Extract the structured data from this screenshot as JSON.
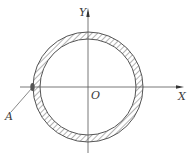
{
  "diagram": {
    "type": "annular cross-section (hollow circular tube) with coordinate axes",
    "labels": {
      "y_axis": "Y",
      "x_axis": "X",
      "origin": "O",
      "point": "A"
    },
    "colors": {
      "line": "#555555",
      "hatch": "#666666",
      "background": "#ffffff"
    },
    "geometry": {
      "center": [
        88,
        87
      ],
      "outer_radius": 55,
      "inner_radius": 48
    }
  }
}
